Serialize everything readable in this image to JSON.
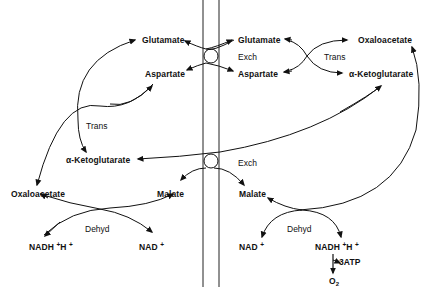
{
  "diagram": {
    "type": "malate-aspartate shuttle",
    "membrane": {
      "color": "#222222"
    },
    "left_compartment": {
      "glutamate": "Glutamate",
      "aspartate": "Aspartate",
      "alpha_ketoglutarate": "α-Ketoglutarate",
      "oxaloacetate": "Oxaloacetate",
      "malate": "Malate",
      "nadh": "NADH",
      "nadh_plus": "+",
      "nadh_h": "H",
      "nadh_h_plus": "+",
      "nad": "NAD",
      "nad_plus": "+",
      "trans": "Trans",
      "dehyd": "Dehyd"
    },
    "right_compartment": {
      "glutamate": "Glutamate",
      "aspartate": "Aspartate",
      "oxaloacetate": "Oxaloacetate",
      "alpha_ketoglutarate": "α-Ketoglutarate",
      "malate": "Malate",
      "nad": "NAD",
      "nad_plus": "+",
      "nadh": "NADH",
      "nadh_plus": "+",
      "nadh_h": "H",
      "nadh_h_plus": "+",
      "atp": "3ATP",
      "o2": "O",
      "o2_sub": "2",
      "trans": "Trans",
      "dehyd": "Dehyd"
    },
    "exchangers": {
      "top": "Exch",
      "bottom": "Exch"
    }
  }
}
